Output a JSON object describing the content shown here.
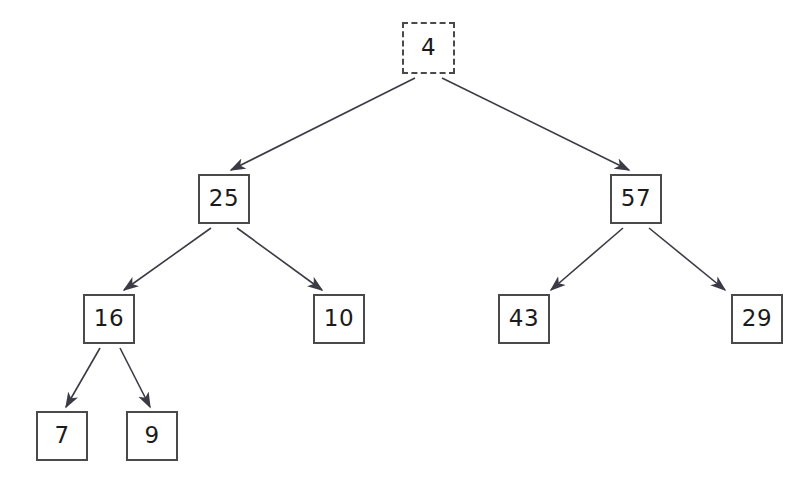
{
  "diagram": {
    "type": "binary-tree",
    "background_color": "#ffffff",
    "node_border_color": "#4a4a4a",
    "edge_color": "#3b3b46",
    "text_color": "#1b1b1b",
    "canvas": {
      "width": 798,
      "height": 491
    },
    "nodes": [
      {
        "id": "n4",
        "label": "4",
        "x": 402,
        "y": 22,
        "w": 53,
        "h": 52,
        "border_style": "dashed",
        "level": 0
      },
      {
        "id": "n25",
        "label": "25",
        "x": 198,
        "y": 174,
        "w": 52,
        "h": 50,
        "border_style": "solid",
        "level": 1
      },
      {
        "id": "n57",
        "label": "57",
        "x": 610,
        "y": 174,
        "w": 52,
        "h": 50,
        "border_style": "solid",
        "level": 1
      },
      {
        "id": "n16",
        "label": "16",
        "x": 83,
        "y": 294,
        "w": 52,
        "h": 50,
        "border_style": "solid",
        "level": 2
      },
      {
        "id": "n10",
        "label": "10",
        "x": 313,
        "y": 294,
        "w": 52,
        "h": 50,
        "border_style": "solid",
        "level": 2
      },
      {
        "id": "n43",
        "label": "43",
        "x": 498,
        "y": 294,
        "w": 52,
        "h": 50,
        "border_style": "solid",
        "level": 2
      },
      {
        "id": "n29",
        "label": "29",
        "x": 731,
        "y": 294,
        "w": 52,
        "h": 50,
        "border_style": "solid",
        "level": 2
      },
      {
        "id": "n7",
        "label": "7",
        "x": 36,
        "y": 411,
        "w": 52,
        "h": 50,
        "border_style": "solid",
        "level": 3
      },
      {
        "id": "n9",
        "label": "9",
        "x": 126,
        "y": 411,
        "w": 52,
        "h": 50,
        "border_style": "solid",
        "level": 3
      }
    ],
    "edges": [
      {
        "id": "e1",
        "from": "n4",
        "to": "n25",
        "x1": 415,
        "y1": 78,
        "x2": 231,
        "y2": 170,
        "arrow": true
      },
      {
        "id": "e2",
        "from": "n4",
        "to": "n57",
        "x1": 442,
        "y1": 78,
        "x2": 629,
        "y2": 170,
        "arrow": true
      },
      {
        "id": "e3",
        "from": "n25",
        "to": "n16",
        "x1": 211,
        "y1": 228,
        "x2": 124,
        "y2": 290,
        "arrow": true
      },
      {
        "id": "e4",
        "from": "n25",
        "to": "n10",
        "x1": 237,
        "y1": 228,
        "x2": 322,
        "y2": 290,
        "arrow": true
      },
      {
        "id": "e5",
        "from": "n57",
        "to": "n43",
        "x1": 623,
        "y1": 228,
        "x2": 551,
        "y2": 290,
        "arrow": true
      },
      {
        "id": "e6",
        "from": "n57",
        "to": "n29",
        "x1": 649,
        "y1": 228,
        "x2": 725,
        "y2": 290,
        "arrow": true
      },
      {
        "id": "e7",
        "from": "n16",
        "to": "n7",
        "x1": 100,
        "y1": 348,
        "x2": 66,
        "y2": 407,
        "arrow": true
      },
      {
        "id": "e8",
        "from": "n16",
        "to": "n9",
        "x1": 120,
        "y1": 348,
        "x2": 150,
        "y2": 407,
        "arrow": true
      }
    ]
  }
}
